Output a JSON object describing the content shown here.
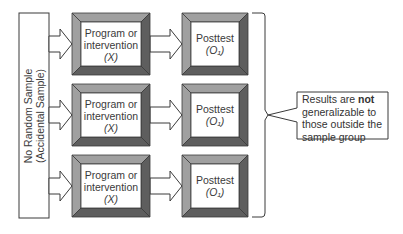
{
  "sample": {
    "line1": "No Random Sample",
    "line2": "(Accidental Sample)"
  },
  "rows": [
    {
      "program": {
        "line1": "Program or",
        "line2": "intervention",
        "line3": "(X)"
      },
      "posttest": {
        "line1": "Posttest",
        "line2": "(O₁)"
      }
    },
    {
      "program": {
        "line1": "Program or",
        "line2": "intervention",
        "line3": "(X)"
      },
      "posttest": {
        "line1": "Posttest",
        "line2": "(O₁)"
      }
    },
    {
      "program": {
        "line1": "Program or",
        "line2": "intervention",
        "line3": "(X)"
      },
      "posttest": {
        "line1": "Posttest",
        "line2": "(O₁)"
      }
    }
  ],
  "callout": {
    "pre": "Results are ",
    "bold": "not",
    "post": " generalizable to those outside the sample group"
  },
  "colors": {
    "bevel_light": "#a0a0a0",
    "bevel_mid": "#8a8a8a",
    "bevel_dark": "#5e5e5e",
    "outline": "#3a3a3a"
  }
}
